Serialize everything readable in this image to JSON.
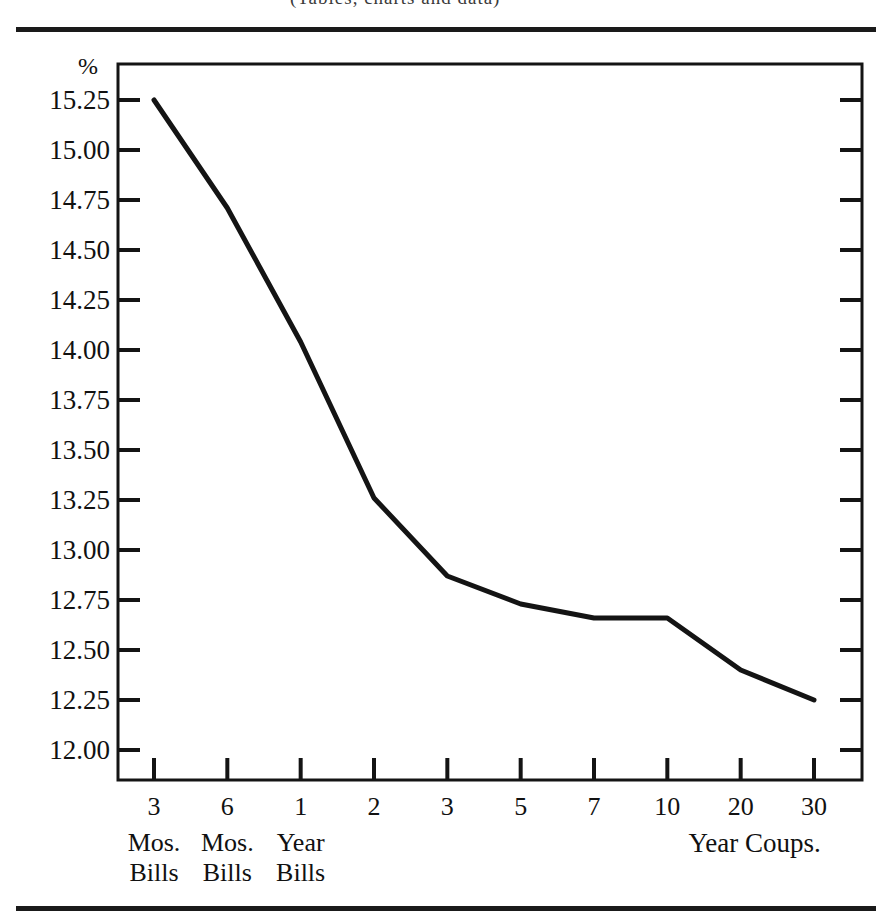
{
  "figure": {
    "top_cut_text": "(Tables, charts and data)",
    "y_axis_unit": "%",
    "rules": {
      "top": true,
      "bottom": true
    }
  },
  "chart_data": {
    "type": "line",
    "title": "",
    "subtitle": "",
    "xlabel": "",
    "ylabel": "%",
    "grid": false,
    "legend": "none",
    "line_color": "#141414",
    "categories": [
      "3",
      "6",
      "1",
      "2",
      "3",
      "5",
      "7",
      "10",
      "20",
      "30"
    ],
    "category_sublabels": [
      [
        "Mos.",
        "Bills"
      ],
      [
        "Mos.",
        "Bills"
      ],
      [
        "Year",
        "Bills"
      ],
      [],
      [],
      [],
      [],
      [],
      [],
      []
    ],
    "group_label_right": "Year Coups.",
    "values": [
      15.25,
      14.71,
      14.04,
      13.26,
      12.87,
      12.73,
      12.66,
      12.66,
      12.4,
      12.25
    ],
    "ylim": [
      11.85,
      15.43
    ],
    "yticks": [
      15.25,
      15.0,
      14.75,
      14.5,
      14.25,
      14.0,
      13.75,
      13.5,
      13.25,
      13.0,
      12.75,
      12.5,
      12.25,
      12.0
    ],
    "ytick_labels": [
      "15.25",
      "15.00",
      "14.75",
      "14.50",
      "14.25",
      "14.00",
      "13.75",
      "13.50",
      "13.25",
      "13.00",
      "12.75",
      "12.50",
      "12.25",
      "12.00"
    ]
  }
}
